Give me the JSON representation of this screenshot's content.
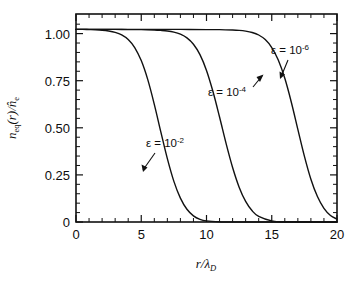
{
  "chart_data": {
    "type": "line",
    "title": "",
    "xlabel": "r/λ_D",
    "ylabel": "n_eq(r)/n̂_e",
    "xlim": [
      0,
      20
    ],
    "ylim": [
      0,
      1.08
    ],
    "grid": false,
    "legend_position": "inline-annotations",
    "x_ticks": [
      0,
      5,
      10,
      15,
      20
    ],
    "x_tick_labels": [
      "0",
      "5",
      "10",
      "15",
      "20"
    ],
    "x_minor_tick_step": 1,
    "y_ticks": [
      0,
      0.25,
      0.5,
      0.75,
      1.0
    ],
    "y_tick_labels": [
      "0",
      "0.25",
      "0.50",
      "0.75",
      "1.00"
    ],
    "y_minor_tick_step": 0.05,
    "series": [
      {
        "name": "ε = 10^-2",
        "label_base": "ε = 10",
        "label_exponent": "-2",
        "midpoint_x": 6.7,
        "x": [
          0.0,
          0.5,
          1.0,
          1.5,
          2.0,
          2.5,
          3.0,
          3.5,
          4.0,
          4.5,
          5.0,
          5.5,
          6.0,
          6.5,
          7.0,
          7.5,
          8.0,
          8.5,
          9.0,
          9.5,
          10.0,
          11.0,
          12.0,
          20.0
        ],
        "values": [
          1.0,
          1.0,
          0.999,
          0.998,
          0.996,
          0.992,
          0.985,
          0.972,
          0.948,
          0.906,
          0.838,
          0.739,
          0.611,
          0.468,
          0.329,
          0.211,
          0.124,
          0.066,
          0.032,
          0.014,
          0.006,
          0.001,
          0.0,
          0.0
        ]
      },
      {
        "name": "ε = 10^-4",
        "label_base": "ε = 10",
        "label_exponent": "-4",
        "midpoint_x": 10.4,
        "x": [
          0.0,
          1.0,
          2.0,
          3.0,
          4.0,
          5.0,
          6.0,
          6.5,
          7.0,
          7.5,
          8.0,
          8.5,
          9.0,
          9.5,
          10.0,
          10.5,
          11.0,
          11.5,
          12.0,
          12.5,
          13.0,
          13.5,
          14.0,
          15.0,
          16.0,
          20.0
        ],
        "values": [
          1.0,
          1.0,
          1.0,
          1.0,
          0.999,
          0.999,
          0.997,
          0.995,
          0.992,
          0.986,
          0.975,
          0.956,
          0.923,
          0.869,
          0.787,
          0.676,
          0.545,
          0.408,
          0.283,
          0.181,
          0.107,
          0.058,
          0.029,
          0.006,
          0.001,
          0.0
        ]
      },
      {
        "name": "ε = 10^-6",
        "label_base": "ε = 10",
        "label_exponent": "-6",
        "midpoint_x": 16.0,
        "x": [
          0.0,
          2.0,
          4.0,
          6.0,
          8.0,
          10.0,
          11.0,
          12.0,
          12.5,
          13.0,
          13.5,
          14.0,
          14.5,
          15.0,
          15.5,
          16.0,
          16.5,
          17.0,
          17.5,
          18.0,
          18.5,
          19.0,
          19.5,
          20.0
        ],
        "values": [
          1.0,
          1.0,
          1.0,
          1.0,
          1.0,
          0.999,
          0.999,
          0.997,
          0.995,
          0.991,
          0.984,
          0.971,
          0.947,
          0.906,
          0.841,
          0.746,
          0.622,
          0.481,
          0.342,
          0.222,
          0.132,
          0.071,
          0.034,
          0.015
        ]
      }
    ],
    "annotations": [
      {
        "text": "ε = 10^-2",
        "base": "ε = 10",
        "exponent": "-2",
        "label_x": 7.0,
        "label_y": 0.455,
        "arrow_to_x": 7.25,
        "arrow_to_y": 0.3
      },
      {
        "text": "ε = 10^-4",
        "base": "ε = 10",
        "exponent": "-4",
        "label_x": 11.3,
        "label_y": 0.735,
        "arrow_to_x": 14.1,
        "arrow_to_y": 0.955
      },
      {
        "text": "ε = 10^-6",
        "base": "ε = 10",
        "exponent": "-6",
        "label_x": 15.8,
        "label_y": 0.915,
        "arrow_to_x": 15.7,
        "arrow_to_y": 0.735
      }
    ]
  },
  "axis": {
    "y_label_numerator": "n",
    "y_label_numerator_sub": "eq",
    "y_label_arg": "(r)/",
    "y_label_denominator": "n̂",
    "y_label_denominator_sub": "e",
    "x_label_main": "r/",
    "x_label_lambda": "λ",
    "x_label_sub": "D"
  }
}
